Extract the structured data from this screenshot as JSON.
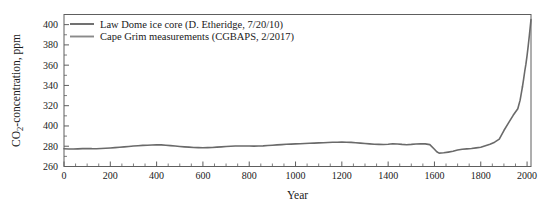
{
  "chart_data": {
    "type": "line",
    "title": "",
    "xlabel": "Year",
    "ylabel": "CO2-concentration, ppm",
    "ylabel_prefix": "CO",
    "ylabel_sub": "2",
    "ylabel_suffix": "-concentration, ppm",
    "xlim": [
      0,
      2017
    ],
    "ylim": [
      260,
      410
    ],
    "grid": false,
    "legend_position": "top-left",
    "line_color": "#6a6a6a",
    "axis_color": "#5e5e5e",
    "background_color": "#ffffff",
    "xticks": [
      0,
      200,
      400,
      600,
      800,
      1000,
      1200,
      1400,
      1600,
      1800,
      2000
    ],
    "xtick_labels": [
      "0",
      "200",
      "400",
      "600",
      "800",
      "1000",
      "1200",
      "1400",
      "1600",
      "1800",
      "2000"
    ],
    "xminor_interval": 50,
    "yticks": [
      260,
      280,
      300,
      320,
      340,
      360,
      380,
      400
    ],
    "ytick_labels": [
      "260",
      "280",
      "400",
      "320",
      "340",
      "360",
      "380",
      "400"
    ],
    "yminor_interval": 10,
    "legend": [
      {
        "label": "Law Dome ice core (D. Etheridge, 7/20/10)",
        "color": "#6a6a6a"
      },
      {
        "label": "Cape Grim measurements (CGBAPS, 2/2017)",
        "color": "#8a8a8a"
      }
    ],
    "series": [
      {
        "name": "Law Dome ice core (D. Etheridge, 7/20/10)",
        "color": "#6a6a6a",
        "x": [
          0,
          20,
          40,
          60,
          80,
          100,
          120,
          140,
          160,
          180,
          200,
          220,
          240,
          260,
          280,
          300,
          320,
          340,
          360,
          380,
          400,
          420,
          440,
          460,
          480,
          500,
          520,
          540,
          560,
          580,
          600,
          620,
          640,
          660,
          680,
          700,
          720,
          740,
          760,
          780,
          800,
          820,
          840,
          860,
          880,
          900,
          920,
          940,
          960,
          980,
          1000,
          1020,
          1040,
          1060,
          1080,
          1100,
          1120,
          1140,
          1160,
          1180,
          1200,
          1220,
          1240,
          1260,
          1280,
          1300,
          1320,
          1340,
          1360,
          1380,
          1400,
          1420,
          1440,
          1460,
          1480,
          1500,
          1520,
          1540,
          1560,
          1580,
          1600,
          1610,
          1620,
          1640,
          1660,
          1680,
          1700,
          1720,
          1740,
          1760,
          1780,
          1800,
          1820,
          1840,
          1860,
          1880,
          1900,
          1920,
          1940,
          1960,
          1970,
          1980
        ],
        "y": [
          277.5,
          277.3,
          277.2,
          277.4,
          277.6,
          277.8,
          277.6,
          277.5,
          277.7,
          278.0,
          278.3,
          278.6,
          279.0,
          279.4,
          279.8,
          280.2,
          280.5,
          280.8,
          281.0,
          281.2,
          281.4,
          281.3,
          281.0,
          280.6,
          280.2,
          279.8,
          279.4,
          279.1,
          278.8,
          278.6,
          278.5,
          278.6,
          278.8,
          279.1,
          279.4,
          279.7,
          280.0,
          280.2,
          280.3,
          280.3,
          280.2,
          280.1,
          280.2,
          280.4,
          280.7,
          281.0,
          281.3,
          281.6,
          281.9,
          282.1,
          282.3,
          282.5,
          282.7,
          282.9,
          283.1,
          283.3,
          283.5,
          283.7,
          283.9,
          284.0,
          284.1,
          284.0,
          283.8,
          283.5,
          283.1,
          282.7,
          282.3,
          282.0,
          281.8,
          281.7,
          282.0,
          282.4,
          282.2,
          281.8,
          281.5,
          281.8,
          282.2,
          282.5,
          282.3,
          281.6,
          277.0,
          274.5,
          273.2,
          273.5,
          274.2,
          275.0,
          276.2,
          277.0,
          277.4,
          277.8,
          278.4,
          279.0,
          280.5,
          282.0,
          284.0,
          287.0,
          295.5,
          303.0,
          310.5,
          317.0,
          325.5,
          338.5
        ]
      },
      {
        "name": "Cape Grim measurements (CGBAPS, 2/2017)",
        "color": "#6a6a6a",
        "x": [
          1980,
          1985,
          1990,
          1995,
          2000,
          2005,
          2010,
          2017
        ],
        "y": [
          338.5,
          346.0,
          354.0,
          361.0,
          369.5,
          379.0,
          389.5,
          405.0
        ]
      }
    ],
    "annotations": []
  }
}
